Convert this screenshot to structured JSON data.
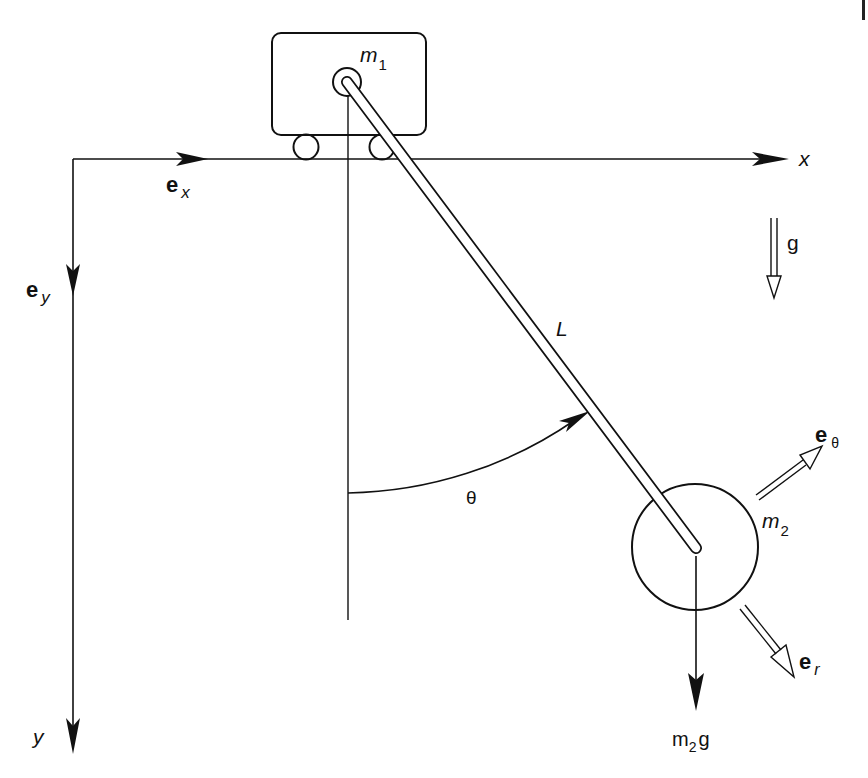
{
  "diagram": {
    "type": "cart-pendulum free-body diagram",
    "colors": {
      "ink": "#111111",
      "background": "#ffffff"
    },
    "cart": {
      "mass_label": "m",
      "mass_subscript": "1"
    },
    "bob": {
      "mass_label": "m",
      "mass_subscript": "2"
    },
    "rod": {
      "length_label": "L"
    },
    "angle": {
      "label": "θ"
    },
    "axes": {
      "x_label": "x",
      "y_label": "y",
      "ex_label": "e",
      "ex_subscript": "x",
      "ey_label": "e",
      "ey_subscript": "y"
    },
    "gravity": {
      "label": "g"
    },
    "weight": {
      "label_m": "m",
      "label_sub": "2",
      "label_g": "g"
    },
    "polar_unit_vectors": {
      "e_theta_label": "e",
      "e_theta_subscript": "θ",
      "e_r_label": "e",
      "e_r_subscript": "r"
    }
  }
}
